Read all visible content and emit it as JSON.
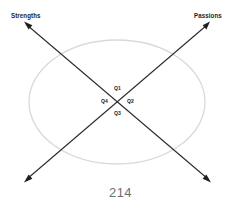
{
  "page": {
    "number": "214",
    "background_color": "#ffffff"
  },
  "diagram": {
    "title_top_left": "Strengths",
    "title_top_right": "Passions",
    "ellipse": {
      "name": "background-ellipse",
      "stroke_color": "#d8d8d8",
      "center_x": 117,
      "center_y": 102,
      "radius_x": 88,
      "radius_y": 62
    },
    "axes": [
      {
        "name": "strengths-axis",
        "label": "Strengths",
        "color": "#262626",
        "from_x": 25,
        "from_y": 23,
        "to_x": 210,
        "to_y": 181,
        "double_headed": true
      },
      {
        "name": "passions-axis",
        "label": "Passions",
        "color": "#262626",
        "from_x": 25,
        "from_y": 181,
        "to_x": 209,
        "to_y": 23,
        "double_headed": true
      }
    ],
    "quadrants": [
      {
        "id": "q1",
        "label": "Q1",
        "position": "top"
      },
      {
        "id": "q2",
        "label": "Q2",
        "position": "right"
      },
      {
        "id": "q3",
        "label": "Q3",
        "position": "bottom"
      },
      {
        "id": "q4",
        "label": "Q4",
        "position": "left"
      }
    ]
  }
}
